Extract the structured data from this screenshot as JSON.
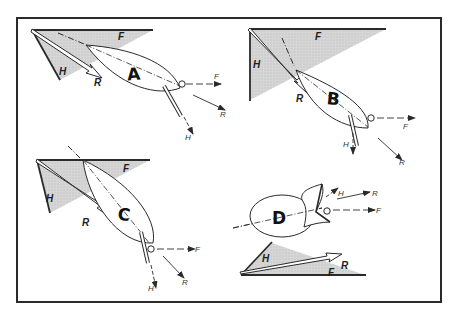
{
  "figure": {
    "colors": {
      "line": "#2a2a2a",
      "shade": "#d2d2d2",
      "background": "#ffffff"
    }
  },
  "panels": [
    {
      "id": "A",
      "boat_label": "A",
      "triangle_labels": {
        "forward": "F",
        "heel": "H",
        "resultant": "R"
      },
      "vector_labels": {
        "forward": "F",
        "resultant": "R",
        "heel": "H"
      }
    },
    {
      "id": "B",
      "boat_label": "B",
      "triangle_labels": {
        "forward": "F",
        "heel": "H",
        "resultant": "R"
      },
      "vector_labels": {
        "forward": "F",
        "resultant": "R",
        "heel": "H"
      }
    },
    {
      "id": "C",
      "boat_label": "C",
      "triangle_labels": {
        "forward": "F",
        "heel": "H",
        "resultant": "R"
      },
      "vector_labels": {
        "forward": "F",
        "resultant": "R",
        "heel": "H"
      }
    },
    {
      "id": "D",
      "boat_label": "D",
      "triangle_labels": {
        "forward": "F",
        "heel": "H",
        "resultant": "R"
      },
      "vector_labels": {
        "forward": "F",
        "resultant": "R",
        "heel": "H"
      }
    }
  ]
}
